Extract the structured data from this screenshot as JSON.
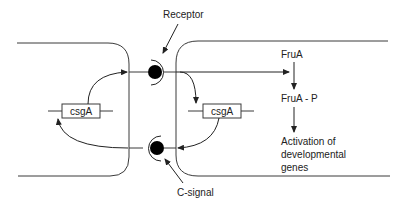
{
  "diagram": {
    "type": "cell-signaling",
    "labels": {
      "receptor": "Receptor",
      "c_signal": "C-signal",
      "csga_left": "csgA",
      "csga_right": "csgA",
      "frua": "FruA",
      "frua_p": "FruA - P",
      "activation_line1": "Activation of",
      "activation_line2": "developmental",
      "activation_line3": "genes"
    },
    "colors": {
      "line": "#3a3a3a",
      "dot": "#000000",
      "text": "#222222",
      "background": "#ffffff"
    },
    "nodes": [
      {
        "id": "left-cell",
        "label": ""
      },
      {
        "id": "right-cell",
        "label": ""
      },
      {
        "id": "receptor-top",
        "label": "Receptor"
      },
      {
        "id": "c-signal-bottom",
        "label": "C-signal"
      },
      {
        "id": "csga-left",
        "label": "csgA"
      },
      {
        "id": "csga-right",
        "label": "csgA"
      },
      {
        "id": "frua",
        "label": "FruA"
      },
      {
        "id": "frua-p",
        "label": "FruA - P"
      },
      {
        "id": "activation",
        "label": "Activation of developmental genes"
      }
    ],
    "edges": [
      {
        "from": "csga-left",
        "to": "receptor-top"
      },
      {
        "from": "receptor-top",
        "to": "csga-right"
      },
      {
        "from": "receptor-top",
        "to": "frua"
      },
      {
        "from": "frua",
        "to": "frua-p"
      },
      {
        "from": "frua-p",
        "to": "activation"
      },
      {
        "from": "csga-right",
        "to": "c-signal-bottom"
      },
      {
        "from": "c-signal-bottom",
        "to": "csga-left"
      }
    ]
  }
}
